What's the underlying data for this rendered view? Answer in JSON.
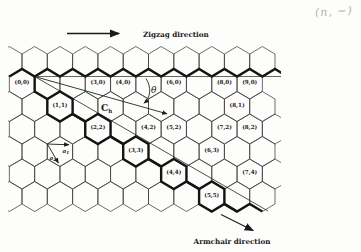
{
  "handwritten_note": "(n, ~)",
  "colors": {
    "ink": "#1a1a1a",
    "lattice_line": "#3d3d3d",
    "bold_chain": "#141414",
    "handwriting": "#b0b0b0"
  },
  "figure": {
    "title_implicit": "Chiral vector map of carbon nanotube on graphene lattice",
    "zigzag_direction_label": "Zigzag direction",
    "armchair_direction_label": "Armchair direction",
    "theta_symbol": "θ",
    "chiral_vector": {
      "base": "C",
      "sub": "h"
    },
    "basis_vectors": [
      {
        "base": "a",
        "sub": "1"
      },
      {
        "base": "a",
        "sub": "2"
      }
    ],
    "hex_labels": [
      {
        "n": 0,
        "m": 0,
        "text": "(0,0)"
      },
      {
        "n": 3,
        "m": 0,
        "text": "(3,0)"
      },
      {
        "n": 4,
        "m": 0,
        "text": "(4,0)"
      },
      {
        "n": 6,
        "m": 0,
        "text": "(6,0)"
      },
      {
        "n": 8,
        "m": 0,
        "text": "(8,0)"
      },
      {
        "n": 9,
        "m": 0,
        "text": "(9,0)"
      },
      {
        "n": 1,
        "m": 1,
        "text": "(1,1)"
      },
      {
        "n": 8,
        "m": 1,
        "text": "(8,1)"
      },
      {
        "n": 2,
        "m": 2,
        "text": "(2,2)"
      },
      {
        "n": 4,
        "m": 2,
        "text": "(4,2)"
      },
      {
        "n": 5,
        "m": 2,
        "text": "(5,2)"
      },
      {
        "n": 7,
        "m": 2,
        "text": "(7,2)"
      },
      {
        "n": 8,
        "m": 2,
        "text": "(8,2)"
      },
      {
        "n": 3,
        "m": 3,
        "text": "(3,3)"
      },
      {
        "n": 6,
        "m": 3,
        "text": "(6,3)"
      },
      {
        "n": 4,
        "m": 4,
        "text": "(4,4)"
      },
      {
        "n": 7,
        "m": 4,
        "text": "(7,4)"
      },
      {
        "n": 5,
        "m": 5,
        "text": "(5,5)"
      }
    ]
  }
}
